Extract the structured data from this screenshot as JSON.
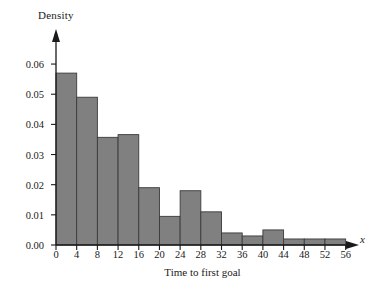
{
  "chart_data": {
    "type": "bar",
    "title": "",
    "xlabel": "Time to first goal",
    "ylabel": "Density",
    "x_axis_variable": "x",
    "grid": false,
    "legend": "none",
    "xlim": [
      0,
      58
    ],
    "ylim": [
      0.0,
      0.064
    ],
    "bin_width": 4,
    "x_ticks": [
      "0",
      "4",
      "8",
      "12",
      "16",
      "20",
      "24",
      "28",
      "32",
      "36",
      "40",
      "44",
      "48",
      "52",
      "56"
    ],
    "x_tick_values": [
      0,
      4,
      8,
      12,
      16,
      20,
      24,
      28,
      32,
      36,
      40,
      44,
      48,
      52,
      56
    ],
    "y_ticks": [
      "0.00",
      "0.01",
      "0.02",
      "0.03",
      "0.04",
      "0.05",
      "0.06"
    ],
    "y_tick_values": [
      0.0,
      0.01,
      0.02,
      0.03,
      0.04,
      0.05,
      0.06
    ],
    "bin_edges": [
      0,
      4,
      8,
      12,
      16,
      20,
      24,
      28,
      32,
      36,
      40,
      44,
      48,
      52,
      56
    ],
    "categories": [
      "0-4",
      "4-8",
      "8-12",
      "12-16",
      "16-20",
      "20-24",
      "24-28",
      "28-32",
      "32-36",
      "36-40",
      "40-44",
      "44-48",
      "48-52",
      "52-56"
    ],
    "values": [
      0.057,
      0.049,
      0.0357,
      0.0366,
      0.019,
      0.0095,
      0.018,
      0.011,
      0.004,
      0.003,
      0.005,
      0.002,
      0.002,
      0.002
    ],
    "bar_fill_color": "#808080",
    "bar_edge_color": "#3a3a3a",
    "axis_color": "#1a1a1a"
  }
}
